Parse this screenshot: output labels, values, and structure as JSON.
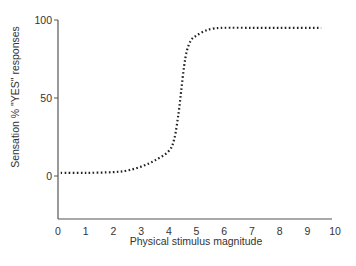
{
  "chart_data": {
    "type": "line",
    "title": "",
    "xlabel": "Physical stimulus magnitude",
    "ylabel": "Sensation % \"YES\" responses",
    "xlim": [
      0,
      10
    ],
    "ylim": [
      -25,
      100
    ],
    "x_ticks": [
      0,
      1,
      2,
      3,
      4,
      5,
      6,
      7,
      8,
      9,
      10
    ],
    "y_ticks": [
      0,
      50,
      100
    ],
    "grid": false,
    "legend": null,
    "series": [
      {
        "name": "psychometric function",
        "style": "dotted",
        "color": "#222222",
        "x": [
          0.1,
          1,
          2,
          2.5,
          3,
          3.5,
          4,
          4.2,
          4.35,
          4.45,
          4.55,
          4.65,
          4.8,
          5,
          5.3,
          5.6,
          6,
          7,
          8,
          9,
          9.5
        ],
        "y": [
          2,
          2,
          2.5,
          3.5,
          6,
          10,
          16,
          24,
          40,
          55,
          70,
          80,
          87,
          90,
          93,
          94.5,
          95,
          95,
          95,
          95,
          95
        ]
      }
    ]
  },
  "colors": {
    "axis": "#555555",
    "curve": "#222222",
    "text": "#333333"
  }
}
